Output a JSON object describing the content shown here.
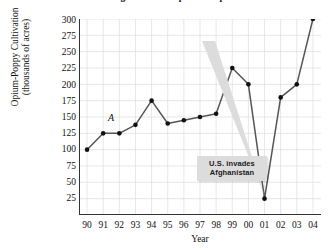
{
  "chart_data": {
    "type": "line",
    "title": "Afghanistan's Opium Crop",
    "xlabel": "Year",
    "ylabel": "Opium-Poppy Cultivation (thousands of acres)",
    "ylabel_line1": "Opium-Poppy Cultivation",
    "ylabel_line2": "(thousands of acres)",
    "categories": [
      "90",
      "91",
      "92",
      "93",
      "94",
      "95",
      "96",
      "97",
      "98",
      "99",
      "00",
      "01",
      "02",
      "03",
      "04"
    ],
    "values": [
      100,
      125,
      125,
      138,
      175,
      140,
      145,
      150,
      155,
      225,
      200,
      25,
      180,
      200,
      300
    ],
    "yticks": [
      300,
      275,
      250,
      225,
      200,
      175,
      150,
      125,
      100,
      75,
      50,
      25
    ],
    "ylim": [
      0,
      300
    ],
    "grid": true,
    "legend": "none",
    "line_color": "#555555",
    "marker_color": "#111111",
    "grid_color": "#dcdcdc",
    "axis_color": "#333333",
    "annotations": [
      {
        "name": "point-label-a",
        "text": "A",
        "style": "italic",
        "near_category": "91"
      },
      {
        "name": "us-invades-callout",
        "line1": "U.S. invades",
        "line2": "Afghanistan",
        "points_to_category": "01",
        "background": "#dcdcdc"
      }
    ]
  }
}
